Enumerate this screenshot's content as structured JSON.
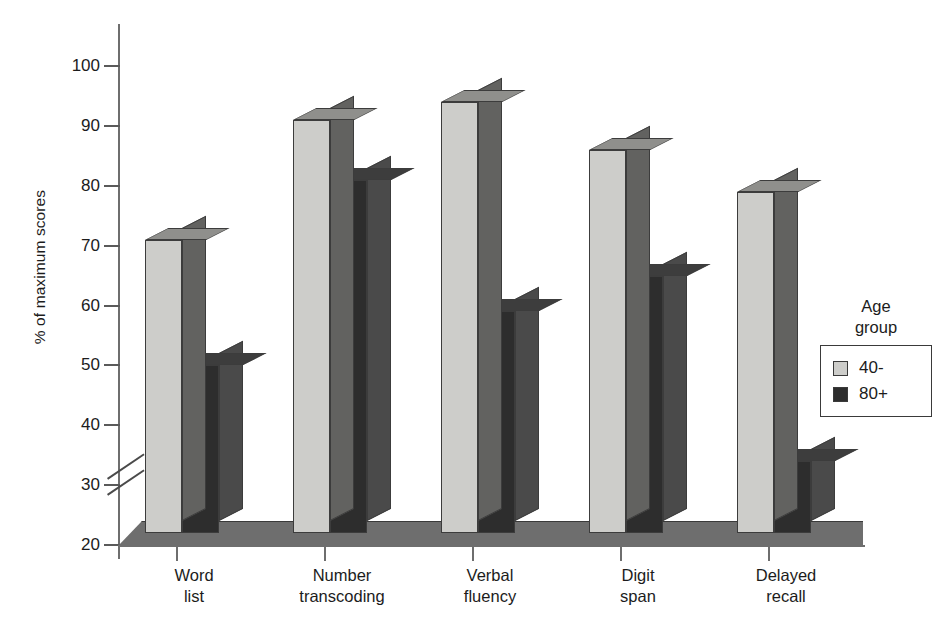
{
  "chart_data": {
    "type": "bar",
    "title": "",
    "subtitle": "",
    "xlabel": "",
    "ylabel": "% of maximum scores",
    "ylim": [
      20,
      100
    ],
    "ytick_values": [
      20,
      30,
      40,
      50,
      60,
      70,
      80,
      90,
      100
    ],
    "ytick_labels": [
      "20",
      "30",
      "40",
      "50",
      "60",
      "70",
      "80",
      "90",
      "100"
    ],
    "axis_break": {
      "present": true,
      "between": [
        30,
        40
      ],
      "label": "axis-break-marks"
    },
    "grid": false,
    "style": "3d-grouped-bars",
    "legend_position": "right",
    "legend_title": "Age group",
    "categories": [
      "Word list",
      "Number transcoding",
      "Verbal fluency",
      "Digit span",
      "Delayed recall"
    ],
    "category_lines": [
      [
        "Word",
        "list"
      ],
      [
        "Number",
        "transcoding"
      ],
      [
        "Verbal",
        "fluency"
      ],
      [
        "Digit",
        "span"
      ],
      [
        "Delayed",
        "recall"
      ]
    ],
    "series": [
      {
        "name": "40-",
        "color": "#cdcdca",
        "values": [
          71,
          91,
          94,
          86,
          79
        ]
      },
      {
        "name": "80+",
        "color": "#2d2d2d",
        "values": [
          50,
          81,
          59,
          65,
          34
        ]
      }
    ]
  },
  "axis": {
    "y_title": "% of maximum scores"
  },
  "legend": {
    "title_lines": [
      "Age",
      "group"
    ],
    "entries": [
      {
        "label": "40-",
        "color": "#cdcdca"
      },
      {
        "label": "80+",
        "color": "#2d2d2d"
      }
    ]
  },
  "colors": {
    "light_front": "#cdcdca",
    "light_side": "#626260",
    "light_top": "#8f8f8c",
    "dark_front": "#2d2d2d",
    "dark_side": "#4a4a4a",
    "dark_top": "#3d3d3d",
    "axis": "#6e6e6e",
    "floor": "#6e6e6e",
    "text": "#1c1c1c",
    "background": "#ffffff"
  }
}
